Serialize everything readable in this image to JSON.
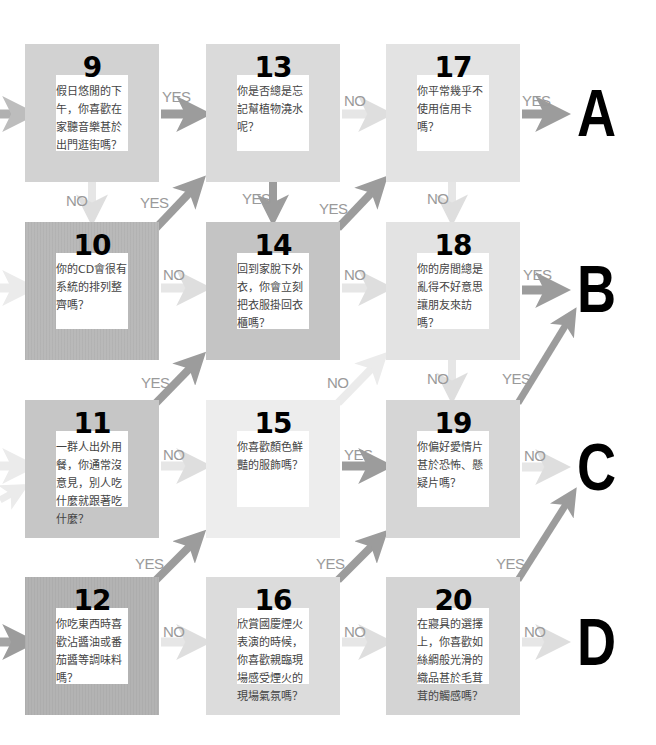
{
  "colors": {
    "box_light": "#ececec",
    "box_mid": "#d9d9d9",
    "box_dark": "#c6c6c6",
    "arrow_yes": "#9c9c9c",
    "arrow_no": "#dedede",
    "label": "#9a9a9a"
  },
  "questions": [
    {
      "num": "9",
      "text": "假日悠閒的下午，你喜歡在家聽音樂甚於出門逛街嗎？"
    },
    {
      "num": "10",
      "text": "你的CD會很有系統的排列整齊嗎？"
    },
    {
      "num": "11",
      "text": "一群人出外用餐，你通常沒意見，別人吃什麼就跟著吃什麼？"
    },
    {
      "num": "12",
      "text": "你吃東西時喜歡沾醬油或番茄醬等調味料嗎？"
    },
    {
      "num": "13",
      "text": "你是否總是忘記幫植物澆水呢？"
    },
    {
      "num": "14",
      "text": "回到家脫下外衣，你會立刻把衣服掛回衣櫃嗎？"
    },
    {
      "num": "15",
      "text": "你喜歡顏色鮮豔的服飾嗎？"
    },
    {
      "num": "16",
      "text": "欣賞國慶煙火表演的時候，你喜歡親臨現場感受煙火的現場氣氛嗎？"
    },
    {
      "num": "17",
      "text": "你平常幾乎不使用信用卡嗎？"
    },
    {
      "num": "18",
      "text": "你的房間總是亂得不好意思讓朋友來訪嗎？"
    },
    {
      "num": "19",
      "text": "你偏好愛情片甚於恐怖、懸疑片嗎？"
    },
    {
      "num": "20",
      "text": "在寢具的選擇上，你喜歡如絲綢般光滑的織品甚於毛茸茸的觸感嗎？"
    }
  ],
  "results": [
    "A",
    "B",
    "C",
    "D"
  ],
  "labels": {
    "yes": "YES",
    "no": "NO"
  }
}
